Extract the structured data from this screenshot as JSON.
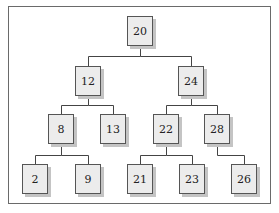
{
  "diagram": {
    "type": "binary-search-tree",
    "nodes": [
      {
        "id": "n20",
        "label": "20",
        "x": 127,
        "y": 16
      },
      {
        "id": "n12",
        "label": "12",
        "x": 75,
        "y": 66
      },
      {
        "id": "n24",
        "label": "24",
        "x": 178,
        "y": 66
      },
      {
        "id": "n8",
        "label": "8",
        "x": 48,
        "y": 114
      },
      {
        "id": "n13",
        "label": "13",
        "x": 100,
        "y": 114
      },
      {
        "id": "n22",
        "label": "22",
        "x": 153,
        "y": 114
      },
      {
        "id": "n28",
        "label": "28",
        "x": 204,
        "y": 114
      },
      {
        "id": "n2",
        "label": "2",
        "x": 22,
        "y": 164
      },
      {
        "id": "n9",
        "label": "9",
        "x": 75,
        "y": 164
      },
      {
        "id": "n21",
        "label": "21",
        "x": 127,
        "y": 164
      },
      {
        "id": "n23",
        "label": "23",
        "x": 179,
        "y": 164
      },
      {
        "id": "n26",
        "label": "26",
        "x": 231,
        "y": 164
      }
    ],
    "edges": [
      [
        "20",
        "12"
      ],
      [
        "20",
        "24"
      ],
      [
        "12",
        "8"
      ],
      [
        "12",
        "13"
      ],
      [
        "24",
        "22"
      ],
      [
        "24",
        "28"
      ],
      [
        "8",
        "2"
      ],
      [
        "8",
        "9"
      ],
      [
        "22",
        "21"
      ],
      [
        "22",
        "23"
      ],
      [
        "28",
        "26"
      ]
    ]
  },
  "colors": {
    "node_fill": "#ececec",
    "node_border": "#555555",
    "shadow": "#c4c4c4",
    "line": "#444444",
    "frame": "#6a6a6a"
  }
}
